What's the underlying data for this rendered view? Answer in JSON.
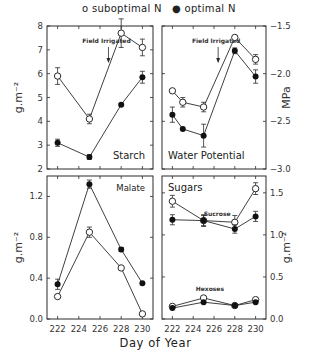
{
  "legend": {
    "suboptimal": "o  suboptimal N",
    "optimal": "●  optimal N"
  },
  "xlabel": "Day of Year",
  "chart_data": [
    {
      "type": "line",
      "title": "Starch",
      "panel": "top-left",
      "ylabel": "g.m⁻²",
      "ylim": [
        2,
        8
      ],
      "yticks": [
        2,
        3,
        4,
        5,
        6,
        7,
        8
      ],
      "xlim": [
        221,
        231
      ],
      "xticks": [
        222,
        224,
        226,
        228,
        230
      ],
      "x": [
        222,
        225,
        228,
        230
      ],
      "annotation": {
        "text": "Field Irrigated",
        "x": 226.8
      },
      "series": [
        {
          "name": "suboptimal N",
          "marker": "open",
          "values": [
            5.9,
            4.1,
            7.7,
            7.1
          ],
          "err": [
            0.35,
            0.2,
            0.6,
            0.35
          ]
        },
        {
          "name": "optimal N",
          "marker": "filled",
          "values": [
            3.1,
            2.5,
            4.7,
            5.85
          ],
          "err": [
            0.15,
            0.1,
            0.05,
            0.25
          ]
        }
      ]
    },
    {
      "type": "line",
      "title": "Water Potential",
      "panel": "top-right",
      "ylabel": "MPa",
      "ylim": [
        -3.0,
        -1.5
      ],
      "yticks": [
        -3.0,
        -2.5,
        -2.0,
        -1.5
      ],
      "xlim": [
        221,
        231
      ],
      "xticks": [
        222,
        224,
        226,
        228,
        230
      ],
      "x": [
        222,
        223.0,
        225,
        228,
        230
      ],
      "annotation": {
        "text": "Field Irrigated",
        "x": 226.4
      },
      "series": [
        {
          "name": "suboptimal N",
          "marker": "open",
          "x": [
            222,
            223,
            225,
            228,
            230
          ],
          "values": [
            -2.18,
            -2.3,
            -2.35,
            -1.62,
            -1.85
          ],
          "err": [
            0.0,
            0.05,
            0.05,
            0.02,
            0.05
          ]
        },
        {
          "name": "optimal N",
          "marker": "filled",
          "x": [
            222,
            223,
            225,
            228,
            230
          ],
          "values": [
            -2.43,
            -2.58,
            -2.65,
            -1.76,
            -2.03
          ],
          "err": [
            0.08,
            0.0,
            0.12,
            0.03,
            0.07
          ]
        }
      ]
    },
    {
      "type": "line",
      "title": "Malate",
      "panel": "bottom-left",
      "ylabel": "g.m⁻²",
      "ylim": [
        0.0,
        1.4
      ],
      "yticks": [
        0.0,
        0.4,
        0.8,
        1.2
      ],
      "xlim": [
        221,
        231
      ],
      "xticks": [
        222,
        224,
        226,
        228,
        230
      ],
      "x": [
        222,
        225,
        228,
        230
      ],
      "series": [
        {
          "name": "suboptimal N",
          "marker": "open",
          "values": [
            0.22,
            0.85,
            0.5,
            0.05
          ],
          "err": [
            0.0,
            0.05,
            0.0,
            0.0
          ]
        },
        {
          "name": "optimal N",
          "marker": "filled",
          "values": [
            0.34,
            1.32,
            0.68,
            0.35
          ],
          "err": [
            0.05,
            0.04,
            0.02,
            0.0
          ]
        }
      ]
    },
    {
      "type": "line",
      "title": "Sugars",
      "panel": "bottom-right",
      "ylabel": "g.m⁻²",
      "ylim": [
        0.0,
        1.7
      ],
      "yticks": [
        0.0,
        0.5,
        1.0,
        1.5
      ],
      "xlim": [
        221,
        231
      ],
      "xticks": [
        222,
        224,
        226,
        228,
        230
      ],
      "x": [
        222,
        225,
        228,
        230
      ],
      "labels": [
        "Sucrose",
        "Hexoses"
      ],
      "series": [
        {
          "name": "Sucrose suboptimal N",
          "marker": "open",
          "values": [
            1.4,
            1.17,
            1.15,
            1.55
          ],
          "err": [
            0.07,
            0.06,
            0.08,
            0.07
          ]
        },
        {
          "name": "Sucrose optimal N",
          "marker": "filled",
          "values": [
            1.18,
            1.17,
            1.07,
            1.22
          ],
          "err": [
            0.06,
            0.07,
            0.05,
            0.06
          ]
        },
        {
          "name": "Hexoses suboptimal N",
          "marker": "open",
          "values": [
            0.15,
            0.25,
            0.16,
            0.23
          ],
          "err": [
            0.0,
            0.0,
            0.0,
            0.0
          ]
        },
        {
          "name": "Hexoses optimal N",
          "marker": "filled",
          "values": [
            0.13,
            0.2,
            0.16,
            0.2
          ],
          "err": [
            0.0,
            0.0,
            0.0,
            0.0
          ]
        }
      ]
    }
  ]
}
